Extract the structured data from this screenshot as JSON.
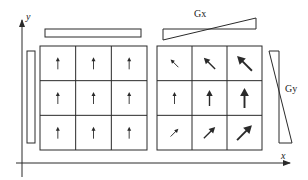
{
  "figure": {
    "type": "mri-phase-encoding-diagram",
    "colors": {
      "stroke": "#2a2a2a",
      "background": "#ffffff"
    },
    "axes": {
      "x_label": "x",
      "y_label": "y"
    },
    "gradients": {
      "gx_label": "Gx",
      "gy_label": "Gy"
    },
    "left_panel": {
      "description": "uniform magnetization, no gradients",
      "grid": [
        [
          {
            "dir": "up",
            "size": 1
          },
          {
            "dir": "up",
            "size": 1
          },
          {
            "dir": "up",
            "size": 1
          }
        ],
        [
          {
            "dir": "up",
            "size": 1
          },
          {
            "dir": "up",
            "size": 1
          },
          {
            "dir": "up",
            "size": 1
          }
        ],
        [
          {
            "dir": "up",
            "size": 1
          },
          {
            "dir": "up",
            "size": 1
          },
          {
            "dir": "up",
            "size": 1
          }
        ]
      ]
    },
    "right_panel": {
      "description": "magnetization with Gx and Gy gradients applied",
      "grid": [
        [
          {
            "dir": "up-left",
            "size": 1
          },
          {
            "dir": "up-left",
            "size": 2
          },
          {
            "dir": "up-left",
            "size": 3
          }
        ],
        [
          {
            "dir": "up",
            "size": 1
          },
          {
            "dir": "up",
            "size": 2
          },
          {
            "dir": "up",
            "size": 3
          }
        ],
        [
          {
            "dir": "up-right",
            "size": 1
          },
          {
            "dir": "up-right",
            "size": 2
          },
          {
            "dir": "up-right",
            "size": 3
          }
        ]
      ]
    }
  }
}
